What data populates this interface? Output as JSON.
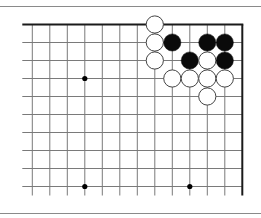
{
  "diagram": {
    "type": "go-board-fragment",
    "corner": "top-right",
    "colors": {
      "grid": "#7a7a7a",
      "edge": "#1a1a1a",
      "black_stone": "#0a0a0a",
      "white_stone_fill": "#ffffff",
      "white_stone_stroke": "#444444",
      "star_point": "#000000",
      "frame": "#8a8a8a"
    },
    "grid": {
      "columns": 13,
      "rows": 10,
      "origin_x": 32.3,
      "origin_y": 24.5,
      "spacing_x": 17.5,
      "spacing_y": 18.0,
      "left_extend": 10,
      "bottom_extend": 9,
      "top_edge": true,
      "right_edge": true
    },
    "star_points": [
      {
        "col": 3,
        "row": 3
      },
      {
        "col": 3,
        "row": 9
      },
      {
        "col": 9,
        "row": 9
      }
    ],
    "stones": [
      {
        "color": "white",
        "col": 7,
        "row": 0
      },
      {
        "color": "white",
        "col": 7,
        "row": 1
      },
      {
        "color": "black",
        "col": 8,
        "row": 1
      },
      {
        "color": "black",
        "col": 10,
        "row": 1
      },
      {
        "color": "black",
        "col": 11,
        "row": 1
      },
      {
        "color": "white",
        "col": 7,
        "row": 2
      },
      {
        "color": "black",
        "col": 9,
        "row": 2
      },
      {
        "color": "white",
        "col": 10,
        "row": 2
      },
      {
        "color": "black",
        "col": 11,
        "row": 2
      },
      {
        "color": "white",
        "col": 8,
        "row": 3
      },
      {
        "color": "white",
        "col": 9,
        "row": 3
      },
      {
        "color": "white",
        "col": 10,
        "row": 3
      },
      {
        "color": "white",
        "col": 11,
        "row": 3
      },
      {
        "color": "white",
        "col": 10,
        "row": 4
      }
    ],
    "stone_radius": 8.6,
    "frame_lines": {
      "top_y": 6,
      "bottom_y": 213
    }
  }
}
